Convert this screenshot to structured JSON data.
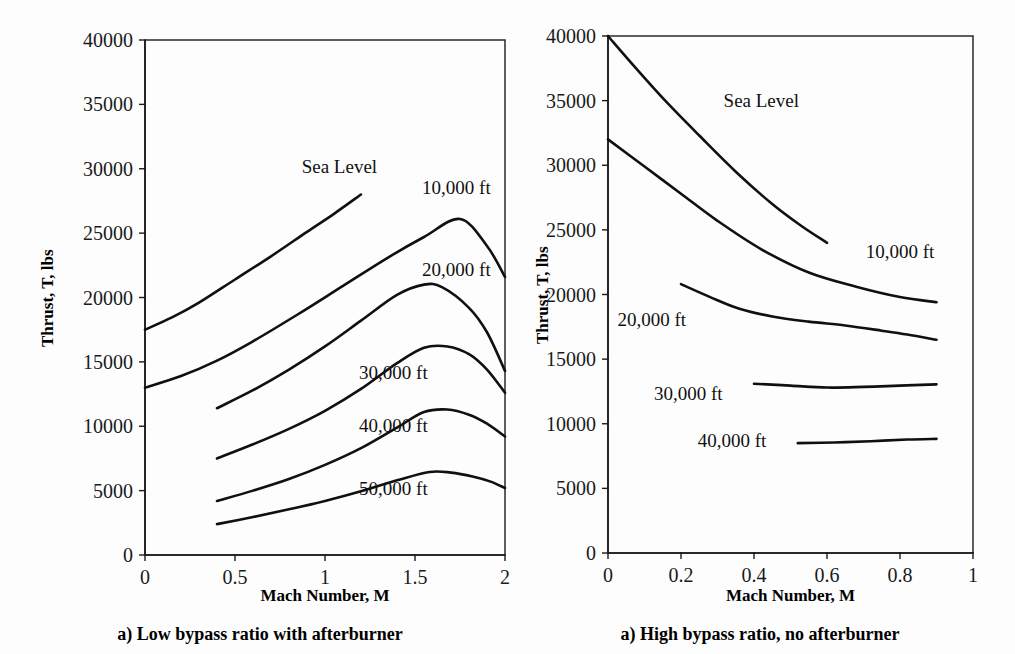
{
  "figure": {
    "background": "#fdfdfd",
    "line_color": "#101010"
  },
  "panels": {
    "left": {
      "caption": "a) Low bypass ratio with afterburner",
      "xlabel": "Mach Number, M",
      "ylabel": "Thrust, T, lbs"
    },
    "right": {
      "caption": "a) High bypass ratio, no afterburner",
      "xlabel": "Mach Number, M",
      "ylabel": "Thrust, T, lbs"
    }
  },
  "chart_data": [
    {
      "id": "low-bypass-afterburner",
      "type": "line",
      "title": "a) Low bypass ratio with afterburner",
      "xlabel": "Mach Number, M",
      "ylabel": "Thrust, T, lbs",
      "xlim": [
        0,
        2
      ],
      "ylim": [
        0,
        40000
      ],
      "xticks": [
        0,
        0.5,
        1,
        1.5,
        2
      ],
      "xtick_labels": [
        "0",
        "0.5",
        "1",
        "1.5",
        "2"
      ],
      "yticks": [
        0,
        5000,
        10000,
        15000,
        20000,
        25000,
        30000,
        35000,
        40000
      ],
      "ytick_labels": [
        "0",
        "5000",
        "10000",
        "15000",
        "20000",
        "25000",
        "30000",
        "35000",
        "40000"
      ],
      "grid": false,
      "legend_position": "inline-annotations",
      "series": [
        {
          "name": "Sea Level",
          "label_x": 1.08,
          "label_y": 30100,
          "label_anchor": "middle",
          "x": [
            0.0,
            0.15,
            0.3,
            0.5,
            0.7,
            0.9,
            1.05,
            1.2
          ],
          "y": [
            17500,
            18450,
            19600,
            21400,
            23200,
            25100,
            26500,
            28000
          ]
        },
        {
          "name": "10,000 ft",
          "label_x": 1.73,
          "label_y": 28500,
          "label_anchor": "middle",
          "x": [
            0.0,
            0.2,
            0.4,
            0.6,
            0.85,
            1.1,
            1.35,
            1.55,
            1.75,
            1.9,
            2.0
          ],
          "y": [
            13000,
            13900,
            15100,
            16600,
            18700,
            20900,
            23100,
            24700,
            26100,
            24000,
            21600
          ]
        },
        {
          "name": "20,000 ft",
          "label_x": 1.73,
          "label_y": 22100,
          "label_anchor": "middle",
          "x": [
            0.4,
            0.6,
            0.8,
            1.0,
            1.2,
            1.4,
            1.55,
            1.65,
            1.8,
            1.9,
            2.0
          ],
          "y": [
            11400,
            12800,
            14400,
            16200,
            18200,
            20200,
            21000,
            20800,
            19200,
            17300,
            14300
          ]
        },
        {
          "name": "30,000 ft",
          "label_x": 1.38,
          "label_y": 14100,
          "label_anchor": "middle",
          "x": [
            0.4,
            0.6,
            0.8,
            1.0,
            1.2,
            1.4,
            1.55,
            1.68,
            1.8,
            1.9,
            2.0
          ],
          "y": [
            7500,
            8600,
            9800,
            11200,
            12900,
            14900,
            16100,
            16200,
            15600,
            14400,
            12600
          ]
        },
        {
          "name": "40,000 ft",
          "label_x": 1.38,
          "label_y": 10000,
          "label_anchor": "middle",
          "x": [
            0.4,
            0.6,
            0.8,
            1.0,
            1.2,
            1.4,
            1.55,
            1.68,
            1.8,
            1.9,
            2.0
          ],
          "y": [
            4200,
            5000,
            5900,
            7000,
            8300,
            9900,
            11100,
            11300,
            10900,
            10200,
            9200
          ]
        },
        {
          "name": "50,000 ft",
          "label_x": 1.38,
          "label_y": 5100,
          "label_anchor": "middle",
          "x": [
            0.4,
            0.6,
            0.8,
            1.0,
            1.2,
            1.4,
            1.58,
            1.7,
            1.82,
            1.92,
            2.0
          ],
          "y": [
            2400,
            2950,
            3550,
            4200,
            4950,
            5800,
            6450,
            6400,
            6100,
            5700,
            5200
          ]
        }
      ]
    },
    {
      "id": "high-bypass-no-afterburner",
      "type": "line",
      "title": "a) High bypass ratio, no afterburner",
      "xlabel": "Mach Number, M",
      "ylabel": "Thrust, T, lbs",
      "xlim": [
        0,
        1
      ],
      "ylim": [
        0,
        40000
      ],
      "xticks": [
        0,
        0.2,
        0.4,
        0.6,
        0.8,
        1
      ],
      "xtick_labels": [
        "0",
        "0.2",
        "0.4",
        "0.6",
        "0.8",
        "1"
      ],
      "yticks": [
        0,
        5000,
        10000,
        15000,
        20000,
        25000,
        30000,
        35000,
        40000
      ],
      "ytick_labels": [
        "0",
        "5000",
        "10000",
        "15000",
        "20000",
        "25000",
        "30000",
        "35000",
        "40000"
      ],
      "grid": false,
      "legend_position": "inline-annotations",
      "series": [
        {
          "name": "Sea Level",
          "label_x": 0.42,
          "label_y": 35000,
          "label_anchor": "middle",
          "x": [
            0.0,
            0.08,
            0.16,
            0.25,
            0.35,
            0.45,
            0.53,
            0.6
          ],
          "y": [
            40000,
            37400,
            34900,
            32300,
            29500,
            27000,
            25300,
            24000
          ]
        },
        {
          "name": "10,000 ft",
          "label_x": 0.8,
          "label_y": 23300,
          "label_anchor": "middle",
          "x": [
            0.0,
            0.1,
            0.2,
            0.3,
            0.42,
            0.55,
            0.68,
            0.8,
            0.9
          ],
          "y": [
            32000,
            29900,
            27800,
            25700,
            23500,
            21700,
            20600,
            19800,
            19400
          ]
        },
        {
          "name": "20,000 ft",
          "label_x": 0.12,
          "label_y": 18000,
          "label_anchor": "middle",
          "x": [
            0.2,
            0.28,
            0.36,
            0.45,
            0.55,
            0.65,
            0.75,
            0.82,
            0.9
          ],
          "y": [
            20800,
            19800,
            18900,
            18300,
            17900,
            17600,
            17200,
            16900,
            16500
          ]
        },
        {
          "name": "30,000 ft",
          "label_x": 0.22,
          "label_y": 12300,
          "label_anchor": "middle",
          "x": [
            0.4,
            0.5,
            0.6,
            0.7,
            0.8,
            0.9
          ],
          "y": [
            13100,
            12950,
            12800,
            12850,
            12950,
            13050
          ]
        },
        {
          "name": "40,000 ft",
          "label_x": 0.34,
          "label_y": 8700,
          "label_anchor": "middle",
          "x": [
            0.52,
            0.62,
            0.72,
            0.82,
            0.9
          ],
          "y": [
            8500,
            8550,
            8650,
            8780,
            8830
          ]
        }
      ]
    }
  ]
}
